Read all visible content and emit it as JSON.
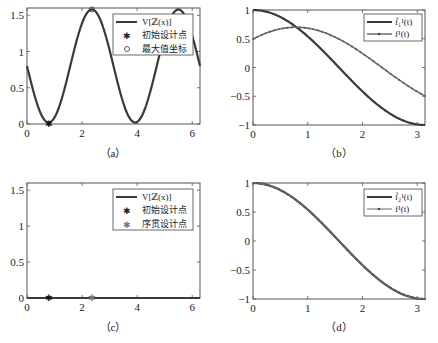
{
  "colors": {
    "curve": "#3a3a3a",
    "curve_light": "#6a6a6a",
    "axis": "#555555",
    "background": "#ffffff"
  },
  "chart_data": [
    {
      "id": "a",
      "type": "line",
      "caption": "（a）",
      "xlim": [
        0,
        6.283
      ],
      "ylim": [
        0,
        1.6
      ],
      "xticks": [
        0,
        2,
        4,
        6
      ],
      "xtick_labels": [
        "0",
        "2",
        "4",
        "6"
      ],
      "yticks": [
        0,
        0.5,
        1,
        1.5
      ],
      "ytick_labels": [
        "0",
        "0.5",
        "1",
        "1.5"
      ],
      "legend_position": "upper right",
      "legend": [
        "V[ℤ(x)]",
        "初始设计点",
        "最大值坐标"
      ],
      "series": [
        {
          "name": "V[ℤ(x)]",
          "style": "thick-line",
          "formula": "0.8 - 0.78*sin(2x)",
          "x": [
            0,
            0.785,
            1.571,
            2.356,
            3.142,
            3.927,
            4.712,
            5.498,
            6.283
          ],
          "y": [
            0.8,
            0.02,
            0.8,
            1.58,
            0.8,
            0.02,
            0.8,
            1.58,
            0.8
          ]
        },
        {
          "name": "初始设计点",
          "style": "star-marker",
          "x": [
            0.785
          ],
          "y": [
            0.0
          ]
        },
        {
          "name": "最大值坐标",
          "style": "circle-marker",
          "x": [
            2.356
          ],
          "y": [
            1.58
          ]
        }
      ]
    },
    {
      "id": "b",
      "type": "line",
      "caption": "（b）",
      "xlim": [
        0,
        3.1416
      ],
      "ylim": [
        -1,
        1
      ],
      "xticks": [
        0,
        1,
        2,
        3
      ],
      "xtick_labels": [
        "0",
        "1",
        "2",
        "3"
      ],
      "yticks": [
        -1,
        -0.5,
        0,
        0.5,
        1
      ],
      "ytick_labels": [
        "−1",
        "−0.5",
        "0",
        "0.5",
        "1"
      ],
      "legend_position": "upper right",
      "legend": [
        "f̃₁¹(t)",
        "f¹(t)"
      ],
      "series": [
        {
          "name": "f̃₁¹(t)",
          "style": "thick-line",
          "formula": "cos(t)",
          "x": [
            0,
            0.5,
            1,
            1.5,
            2,
            2.5,
            3,
            3.1416
          ],
          "y": [
            1,
            0.88,
            0.54,
            0.07,
            -0.42,
            -0.8,
            -0.99,
            -1
          ]
        },
        {
          "name": "f¹(t)",
          "style": "line-with-dots",
          "formula": "0.7*cos(t-0.785)",
          "x": [
            0,
            0.5,
            0.785,
            1,
            1.5,
            2,
            2.5,
            3,
            3.1416
          ],
          "y": [
            0.5,
            0.67,
            0.7,
            0.68,
            0.53,
            0.24,
            -0.1,
            -0.41,
            -0.5
          ]
        }
      ]
    },
    {
      "id": "c",
      "type": "line",
      "caption": "（c）",
      "xlim": [
        0,
        6.283
      ],
      "ylim": [
        0,
        1.6
      ],
      "xticks": [
        0,
        2,
        4,
        6
      ],
      "xtick_labels": [
        "0",
        "2",
        "4",
        "6"
      ],
      "yticks": [
        0,
        0.5,
        1,
        1.5
      ],
      "ytick_labels": [
        "0",
        "0.5",
        "1",
        "1.5"
      ],
      "legend_position": "upper right",
      "legend": [
        "V[ℤ(x)]",
        "初始设计点",
        "序贯设计点"
      ],
      "series": [
        {
          "name": "V[ℤ(x)]",
          "style": "thick-line",
          "formula": "0",
          "x": [
            0,
            6.283
          ],
          "y": [
            0,
            0
          ]
        },
        {
          "name": "初始设计点",
          "style": "star-marker",
          "x": [
            0.785
          ],
          "y": [
            0.0
          ]
        },
        {
          "name": "序贯设计点",
          "style": "star-marker-light",
          "x": [
            2.356
          ],
          "y": [
            0.0
          ]
        }
      ]
    },
    {
      "id": "d",
      "type": "line",
      "caption": "（d）",
      "xlim": [
        0,
        3.1416
      ],
      "ylim": [
        -1,
        1
      ],
      "xticks": [
        0,
        1,
        2,
        3
      ],
      "xtick_labels": [
        "0",
        "1",
        "2",
        "3"
      ],
      "yticks": [
        -1,
        -0.5,
        0,
        0.5,
        1
      ],
      "ytick_labels": [
        "−1",
        "−0.5",
        "0",
        "0.5",
        "1"
      ],
      "legend_position": "upper right",
      "legend": [
        "f̃₂¹(t)",
        "f¹(t)"
      ],
      "series": [
        {
          "name": "f̃₂¹(t)",
          "style": "thick-line",
          "formula": "cos(t)",
          "x": [
            0,
            0.5,
            1,
            1.5,
            2,
            2.5,
            3,
            3.1416
          ],
          "y": [
            1,
            0.88,
            0.54,
            0.07,
            -0.42,
            -0.8,
            -0.99,
            -1
          ]
        },
        {
          "name": "f¹(t)",
          "style": "line-with-dots",
          "formula": "cos(t)",
          "x": [
            0,
            0.5,
            1,
            1.5,
            2,
            2.5,
            3,
            3.1416
          ],
          "y": [
            1,
            0.88,
            0.54,
            0.07,
            -0.42,
            -0.8,
            -0.99,
            -1
          ]
        }
      ]
    }
  ]
}
